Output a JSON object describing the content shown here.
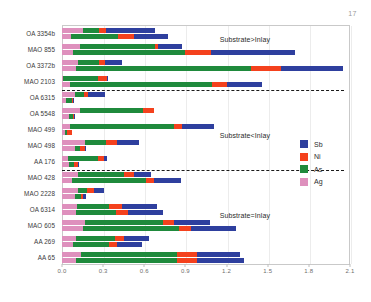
{
  "page": {
    "number": "17"
  },
  "chart_data": {
    "type": "bar",
    "orientation": "horizontal",
    "stacked": true,
    "grouped_pairs": true,
    "title": "",
    "xlabel": "",
    "ylabel": "",
    "xlim": [
      0.0,
      2.1
    ],
    "xticks": [
      "0.0",
      "0.3",
      "0.6",
      "0.9",
      "1.2",
      "1.5",
      "1.8",
      "2.1"
    ],
    "xtick_values": [
      0.0,
      0.3,
      0.6,
      0.9,
      1.2,
      1.5,
      1.8,
      2.1
    ],
    "grid": false,
    "legend_position": "right",
    "series": [
      {
        "name": "Sb",
        "color": "#2e3f9e"
      },
      {
        "name": "Ni",
        "color": "#f4411d"
      },
      {
        "name": "As",
        "color": "#1f8a3c"
      },
      {
        "name": "Ag",
        "color": "#de90bd"
      }
    ],
    "stack_order": [
      "Ag",
      "As",
      "Ni",
      "Sb"
    ],
    "categories": [
      "OA 3354b",
      "MAO 855",
      "OA 3372b",
      "MAO 2103",
      "OA 6315",
      "OA 5548",
      "MAO 499",
      "MAO 498",
      "AA 176",
      "MAO 428",
      "MAO 2228",
      "OA 6314",
      "MAO 605",
      "AA 269",
      "AA 65"
    ],
    "bars": [
      {
        "category": "OA 3354b",
        "sub": "substrate",
        "Ag": 0.155,
        "As": 0.115,
        "Ni": 0.05,
        "Sb": 0.355,
        "total": 0.675
      },
      {
        "category": "OA 3354b",
        "sub": "inlay",
        "Ag": 0.065,
        "As": 0.345,
        "Ni": 0.115,
        "Sb": 0.245,
        "total": 0.77
      },
      {
        "category": "MAO 855",
        "sub": "substrate",
        "Ag": 0.13,
        "As": 0.545,
        "Ni": 0.025,
        "Sb": 0.175,
        "total": 0.875
      },
      {
        "category": "MAO 855",
        "sub": "inlay",
        "Ag": 0.08,
        "As": 0.82,
        "Ni": 0.185,
        "Sb": 0.615,
        "total": 1.7
      },
      {
        "category": "OA 3372b",
        "sub": "substrate",
        "Ag": 0.12,
        "As": 0.15,
        "Ni": 0.045,
        "Sb": 0.125,
        "total": 0.44
      },
      {
        "category": "OA 3372b",
        "sub": "inlay",
        "Ag": 0.105,
        "As": 1.275,
        "Ni": 0.215,
        "Sb": 0.455,
        "total": 2.05
      },
      {
        "category": "MAO 2103",
        "sub": "substrate",
        "Ag": 0.01,
        "As": 0.255,
        "Ni": 0.06,
        "Sb": 0.01,
        "total": 0.335
      },
      {
        "category": "MAO 2103",
        "sub": "inlay",
        "Ag": 0.055,
        "As": 1.04,
        "Ni": 0.11,
        "Sb": 0.255,
        "total": 1.46
      },
      {
        "category": "OA 6315",
        "sub": "substrate",
        "Ag": 0.095,
        "As": 0.065,
        "Ni": 0.03,
        "Sb": 0.125,
        "total": 0.315
      },
      {
        "category": "OA 6315",
        "sub": "inlay",
        "Ag": 0.03,
        "As": 0.045,
        "Ni": 0.005,
        "Sb": 0.005,
        "total": 0.085
      },
      {
        "category": "OA 5548",
        "sub": "substrate",
        "Ag": 0.13,
        "As": 0.46,
        "Ni": 0.08,
        "Sb": 0.0,
        "total": 0.67
      },
      {
        "category": "OA 5548",
        "sub": "inlay",
        "Ag": 0.05,
        "As": 0.03,
        "Ni": 0.01,
        "Sb": 0.005,
        "total": 0.095
      },
      {
        "category": "MAO 499",
        "sub": "substrate",
        "Ag": 0.06,
        "As": 0.755,
        "Ni": 0.06,
        "Sb": 0.23,
        "total": 1.105
      },
      {
        "category": "MAO 499",
        "sub": "inlay",
        "Ag": 0.02,
        "As": 0.015,
        "Ni": 0.035,
        "Sb": 0.0,
        "total": 0.07
      },
      {
        "category": "MAO 498",
        "sub": "substrate",
        "Ag": 0.165,
        "As": 0.155,
        "Ni": 0.08,
        "Sb": 0.165,
        "total": 0.565
      },
      {
        "category": "MAO 498",
        "sub": "inlay",
        "Ag": 0.095,
        "As": 0.035,
        "Ni": 0.04,
        "Sb": 0.005,
        "total": 0.175
      },
      {
        "category": "AA 176",
        "sub": "substrate",
        "Ag": 0.045,
        "As": 0.215,
        "Ni": 0.045,
        "Sb": 0.02,
        "total": 0.325
      },
      {
        "category": "AA 176",
        "sub": "inlay",
        "Ag": 0.05,
        "As": 0.035,
        "Ni": 0.03,
        "Sb": 0.01,
        "total": 0.125
      },
      {
        "category": "MAO 428",
        "sub": "substrate",
        "Ag": 0.115,
        "As": 0.34,
        "Ni": 0.07,
        "Sb": 0.125,
        "total": 0.65
      },
      {
        "category": "MAO 428",
        "sub": "inlay",
        "Ag": 0.07,
        "As": 0.545,
        "Ni": 0.055,
        "Sb": 0.195,
        "total": 0.865
      },
      {
        "category": "MAO 2228",
        "sub": "substrate",
        "Ag": 0.115,
        "As": 0.065,
        "Ni": 0.055,
        "Sb": 0.07,
        "total": 0.305
      },
      {
        "category": "MAO 2228",
        "sub": "inlay",
        "Ag": 0.095,
        "As": 0.04,
        "Ni": 0.015,
        "Sb": 0.025,
        "total": 0.175
      },
      {
        "category": "OA 6314",
        "sub": "substrate",
        "Ag": 0.11,
        "As": 0.235,
        "Ni": 0.09,
        "Sb": 0.255,
        "total": 0.69
      },
      {
        "category": "OA 6314",
        "sub": "inlay",
        "Ag": 0.105,
        "As": 0.29,
        "Ni": 0.09,
        "Sb": 0.255,
        "total": 0.74
      },
      {
        "category": "MAO 605",
        "sub": "substrate",
        "Ag": 0.165,
        "As": 0.575,
        "Ni": 0.075,
        "Sb": 0.265,
        "total": 1.08
      },
      {
        "category": "MAO 605",
        "sub": "inlay",
        "Ag": 0.155,
        "As": 0.7,
        "Ni": 0.085,
        "Sb": 0.33,
        "total": 1.27
      },
      {
        "category": "AA 269",
        "sub": "substrate",
        "Ag": 0.105,
        "As": 0.28,
        "Ni": 0.065,
        "Sb": 0.185,
        "total": 0.635
      },
      {
        "category": "AA 269",
        "sub": "inlay",
        "Ag": 0.08,
        "As": 0.265,
        "Ni": 0.055,
        "Sb": 0.185,
        "total": 0.585
      },
      {
        "category": "AA 65",
        "sub": "substrate",
        "Ag": 0.135,
        "As": 0.7,
        "Ni": 0.15,
        "Sb": 0.315,
        "total": 1.3
      },
      {
        "category": "AA 65",
        "sub": "inlay",
        "Ag": 0.1,
        "As": 0.74,
        "Ni": 0.145,
        "Sb": 0.345,
        "total": 1.33
      }
    ],
    "annotations": [
      {
        "text": "Substrate>Inlay",
        "x": 1.15,
        "y_index": 0.5
      },
      {
        "text": "Substrate<Inlay",
        "x": 1.15,
        "y_index": 6.5
      },
      {
        "text": "Substrate=Inlay",
        "x": 1.15,
        "y_index": 11.5
      }
    ],
    "dividers": [
      {
        "after_category": "MAO 2103"
      },
      {
        "after_category": "AA 176"
      }
    ]
  }
}
